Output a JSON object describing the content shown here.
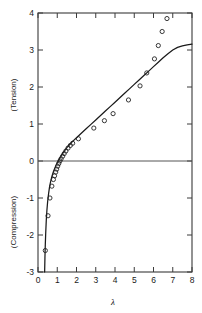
{
  "chart_data": {
    "type": "scatter",
    "title": "",
    "subtitle": "",
    "xlabel": "λ",
    "ylabel": "",
    "ylabel_upper": "(Tension)",
    "ylabel_lower": "(Compression)",
    "xlim": [
      0,
      8
    ],
    "ylim": [
      -3,
      4
    ],
    "grid": false,
    "legend": "none",
    "x_ticks": [
      0,
      1,
      2,
      3,
      4,
      5,
      6,
      7,
      8
    ],
    "x_tick_labels": [
      "0",
      "1",
      "2",
      "3",
      "4",
      "5",
      "6",
      "7",
      "8"
    ],
    "y_ticks": [
      -3,
      -2,
      -1,
      0,
      1,
      2,
      3,
      4
    ],
    "y_tick_labels": [
      "-3",
      "-2",
      "-1",
      "0",
      "1",
      "2",
      "3",
      "4"
    ],
    "zero_line": 0,
    "series": [
      {
        "name": "experimental data",
        "marker": "open-circle",
        "marker_color": "#222222",
        "points": [
          [
            0.38,
            -2.42
          ],
          [
            0.52,
            -1.48
          ],
          [
            0.62,
            -1.0
          ],
          [
            0.72,
            -0.68
          ],
          [
            0.8,
            -0.5
          ],
          [
            0.86,
            -0.4
          ],
          [
            0.92,
            -0.3
          ],
          [
            0.97,
            -0.22
          ],
          [
            1.02,
            -0.14
          ],
          [
            1.08,
            -0.07
          ],
          [
            1.14,
            0.0
          ],
          [
            1.2,
            0.06
          ],
          [
            1.28,
            0.13
          ],
          [
            1.36,
            0.2
          ],
          [
            1.45,
            0.27
          ],
          [
            1.56,
            0.35
          ],
          [
            1.68,
            0.42
          ],
          [
            1.8,
            0.48
          ],
          [
            2.1,
            0.6
          ],
          [
            2.9,
            0.89
          ],
          [
            3.45,
            1.09
          ],
          [
            3.9,
            1.28
          ],
          [
            4.7,
            1.65
          ],
          [
            5.3,
            2.03
          ],
          [
            5.65,
            2.38
          ],
          [
            6.05,
            2.76
          ],
          [
            6.25,
            3.12
          ],
          [
            6.45,
            3.5
          ],
          [
            6.7,
            3.85
          ]
        ]
      },
      {
        "name": "theoretical curve",
        "marker": "none",
        "line_color": "#1a1a1a",
        "points": [
          [
            0.345,
            -3.0
          ],
          [
            0.36,
            -2.62
          ],
          [
            0.38,
            -2.25
          ],
          [
            0.4,
            -1.95
          ],
          [
            0.43,
            -1.6
          ],
          [
            0.46,
            -1.35
          ],
          [
            0.5,
            -1.1
          ],
          [
            0.55,
            -0.88
          ],
          [
            0.6,
            -0.7
          ],
          [
            0.65,
            -0.57
          ],
          [
            0.7,
            -0.46
          ],
          [
            0.75,
            -0.37
          ],
          [
            0.8,
            -0.29
          ],
          [
            0.85,
            -0.22
          ],
          [
            0.9,
            -0.16
          ],
          [
            0.95,
            -0.1
          ],
          [
            1.0,
            -0.05
          ],
          [
            1.05,
            0.0
          ],
          [
            1.1,
            0.05
          ],
          [
            1.2,
            0.14
          ],
          [
            1.3,
            0.22
          ],
          [
            1.4,
            0.29
          ],
          [
            1.5,
            0.36
          ],
          [
            1.6,
            0.42
          ],
          [
            1.8,
            0.53
          ],
          [
            2.0,
            0.63
          ],
          [
            2.25,
            0.75
          ],
          [
            2.5,
            0.87
          ],
          [
            2.75,
            0.99
          ],
          [
            3.0,
            1.11
          ],
          [
            3.25,
            1.23
          ],
          [
            3.5,
            1.35
          ],
          [
            3.75,
            1.47
          ],
          [
            4.0,
            1.59
          ],
          [
            4.25,
            1.71
          ],
          [
            4.5,
            1.83
          ],
          [
            4.75,
            1.95
          ],
          [
            5.0,
            2.07
          ],
          [
            5.25,
            2.19
          ],
          [
            5.5,
            2.31
          ],
          [
            5.75,
            2.43
          ],
          [
            6.0,
            2.55
          ],
          [
            6.25,
            2.67
          ],
          [
            6.5,
            2.79
          ],
          [
            6.75,
            2.9
          ],
          [
            7.0,
            3.0
          ],
          [
            7.25,
            3.07
          ],
          [
            7.5,
            3.11
          ],
          [
            7.75,
            3.14
          ],
          [
            8.0,
            3.16
          ]
        ]
      }
    ]
  }
}
